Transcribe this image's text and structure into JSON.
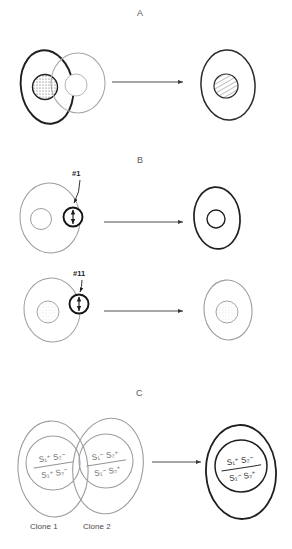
{
  "figure": {
    "background_color": "#ffffff",
    "ink_color": "#2a2a2a",
    "light_ink_color": "#9a9a9a",
    "width": 292,
    "height": 549
  },
  "topstrip": {
    "text": "",
    "note": "faint clipped text at top edge"
  },
  "panels": [
    {
      "id": "A",
      "letter": "A",
      "letter_x": 140,
      "letter_y": 10,
      "arrow": {
        "x1": 112,
        "y1": 82,
        "x2": 186,
        "y2": 82
      },
      "left_group": [
        {
          "name": "cell-bold-stippled",
          "outline": "bold",
          "nucleus_fill": "stippled-dark"
        },
        {
          "name": "cell-light-plain",
          "outline": "light",
          "nucleus_fill": "plain-light"
        }
      ],
      "right_group": [
        {
          "name": "cell-fusion-product",
          "outline": "medium",
          "nucleus_fill": "hatched"
        }
      ]
    },
    {
      "id": "B1",
      "letter": "B",
      "letter_x": 140,
      "letter_y": 158,
      "tag": "#1",
      "tag_x": 74,
      "tag_y": 170,
      "arrow": {
        "x1": 104,
        "y1": 222,
        "x2": 186,
        "y2": 222
      },
      "left_group": [
        {
          "name": "cell-light-plain",
          "outline": "light",
          "nucleus_fill": "plain-light"
        },
        {
          "name": "pollen-grain",
          "outline": "bold",
          "nucleus_fill": "arrow-symbol"
        }
      ],
      "right_group": [
        {
          "name": "cell-bold-plain",
          "outline": "bold",
          "nucleus_fill": "plain-white"
        }
      ]
    },
    {
      "id": "B2",
      "letter": "",
      "tag": "#11",
      "tag_x": 72,
      "tag_y": 270,
      "arrow": {
        "x1": 104,
        "y1": 311,
        "x2": 186,
        "y2": 311
      },
      "left_group": [
        {
          "name": "cell-light-plain",
          "outline": "light",
          "nucleus_fill": "stippled-light"
        },
        {
          "name": "pollen-grain",
          "outline": "bold",
          "nucleus_fill": "arrow-symbol"
        }
      ],
      "right_group": [
        {
          "name": "cell-light-plain",
          "outline": "light",
          "nucleus_fill": "stippled-light"
        }
      ]
    },
    {
      "id": "C",
      "letter": "C",
      "letter_x": 139,
      "letter_y": 390,
      "arrow": {
        "x1": 152,
        "y1": 462,
        "x2": 204,
        "y2": 462
      },
      "left_group": [
        {
          "name": "clone-1-cell",
          "outline": "light",
          "label": "Clone 1",
          "label_x": 18,
          "label_y": 528,
          "genotype_top": "S₁⁺ S₂⁻",
          "genotype_bottom": "S₁⁺ S₂⁻"
        },
        {
          "name": "clone-2-cell",
          "outline": "light",
          "label": "Clone 2",
          "label_x": 70,
          "label_y": 528,
          "genotype_top": "S₁⁻ S₂⁺",
          "genotype_bottom": "S₁⁻ S₂⁺"
        }
      ],
      "right_group": [
        {
          "name": "hybrid-cell",
          "outline": "bold",
          "genotype_top": "S₁⁺ S₂⁻",
          "genotype_bottom": "S₁⁻ S₂⁺"
        }
      ]
    }
  ],
  "labels": {
    "panel_a": "A",
    "panel_b": "B",
    "panel_c": "C",
    "tag_1": "#1",
    "tag_11": "#11",
    "clone_1": "Clone 1",
    "clone_2": "Clone 2",
    "genotype_a_top": "S₁⁺ S₂⁻",
    "genotype_a_bottom": "S₁⁺ S₂⁻",
    "genotype_b_top": "S₁⁻ S₂⁺",
    "genotype_b_bottom": "S₁⁻ S₂⁺",
    "genotype_c_top": "S₁⁺ S₂⁻",
    "genotype_c_bottom": "S₁⁻ S₂⁺"
  }
}
